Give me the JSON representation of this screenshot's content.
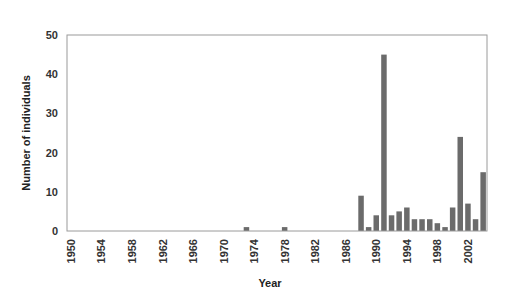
{
  "chart_data": {
    "type": "bar",
    "title": "",
    "xlabel": "Year",
    "ylabel": "Number of individuals",
    "ylim": [
      0,
      50
    ],
    "yticks": [
      0,
      10,
      20,
      30,
      40,
      50
    ],
    "xtick_labels": [
      "1950",
      "1954",
      "1958",
      "1962",
      "1966",
      "1970",
      "1974",
      "1978",
      "1982",
      "1986",
      "1990",
      "1994",
      "1998",
      "2002"
    ],
    "grid": false,
    "legend": null,
    "bar_color": "#6b6b6b",
    "categories": [
      1950,
      1951,
      1952,
      1953,
      1954,
      1955,
      1956,
      1957,
      1958,
      1959,
      1960,
      1961,
      1962,
      1963,
      1964,
      1965,
      1966,
      1967,
      1968,
      1969,
      1970,
      1971,
      1972,
      1973,
      1974,
      1975,
      1976,
      1977,
      1978,
      1979,
      1980,
      1981,
      1982,
      1983,
      1984,
      1985,
      1986,
      1987,
      1988,
      1989,
      1990,
      1991,
      1992,
      1993,
      1994,
      1995,
      1996,
      1997,
      1998,
      1999,
      2000,
      2001,
      2002,
      2003,
      2004
    ],
    "values": [
      0,
      0,
      0,
      0,
      0,
      0,
      0,
      0,
      0,
      0,
      0,
      0,
      0,
      0,
      0,
      0,
      0,
      0,
      0,
      0,
      0,
      0,
      0,
      1,
      0,
      0,
      0,
      0,
      1,
      0,
      0,
      0,
      0,
      0,
      0,
      0,
      0,
      0,
      9,
      1,
      4,
      45,
      4,
      5,
      6,
      3,
      3,
      3,
      2,
      1,
      6,
      24,
      7,
      3,
      15
    ]
  }
}
